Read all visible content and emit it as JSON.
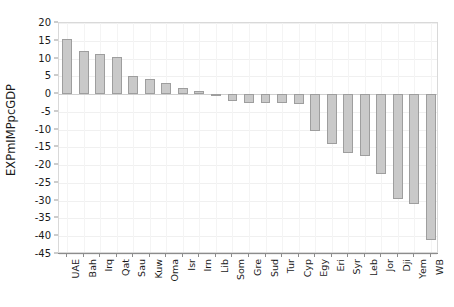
{
  "chart_data": {
    "type": "bar",
    "title": "",
    "subtitle": "",
    "xlabel": "",
    "ylabel": "EXPmIMPpcGDP",
    "ylim": [
      -45,
      20
    ],
    "ytick_step": 5,
    "grid": true,
    "legend": "none",
    "orientation": "vertical",
    "bar_color": "#c9c9c9",
    "bar_border_color": "#9e9e9e",
    "yticks": [
      20,
      15,
      10,
      5,
      0,
      -5,
      -10,
      -15,
      -20,
      -25,
      -30,
      -35,
      -40,
      -45
    ],
    "ytick_labels": [
      "20",
      "15",
      "10",
      "5",
      "0",
      "-5",
      "-10",
      "-15",
      "-20",
      "-25",
      "-30",
      "-35",
      "-40",
      "-45"
    ],
    "categories": [
      "UAE",
      "Bah",
      "Irq",
      "Qat",
      "Sau",
      "Kuw",
      "Oma",
      "Isr",
      "Irn",
      "Lib",
      "Som",
      "Gre",
      "Sud",
      "Tur",
      "Cyp",
      "Egy",
      "Eri",
      "Syr",
      "Leb",
      "Jor",
      "Dji",
      "Yem",
      "WB"
    ],
    "values": [
      15.5,
      12.0,
      11.4,
      10.3,
      5.0,
      4.2,
      3.2,
      1.6,
      0.9,
      -0.2,
      -2.0,
      -2.4,
      -2.5,
      -2.6,
      -2.7,
      -10.5,
      -14.0,
      -16.5,
      -17.5,
      -22.5,
      -29.5,
      -31.0,
      -41.0
    ]
  },
  "colors": {
    "bar_fill": "#c9c9c9",
    "bar_stroke": "#9e9e9e",
    "gridline": "#f0f0f0",
    "axis": "#8c8c8c",
    "frame": "#d9d9d9",
    "text": "#1a1a1a",
    "background": "#ffffff"
  }
}
